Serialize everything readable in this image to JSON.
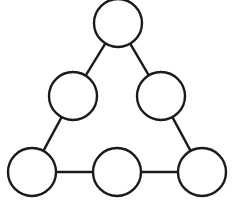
{
  "diagram": {
    "type": "triangle-node-graph",
    "nodes": [
      {
        "id": "top",
        "label": ""
      },
      {
        "id": "middle-left",
        "label": ""
      },
      {
        "id": "middle-right",
        "label": ""
      },
      {
        "id": "bottom-left",
        "label": ""
      },
      {
        "id": "bottom-middle",
        "label": ""
      },
      {
        "id": "bottom-right",
        "label": ""
      }
    ],
    "edges": [
      [
        "top",
        "middle-left"
      ],
      [
        "middle-left",
        "bottom-left"
      ],
      [
        "top",
        "middle-right"
      ],
      [
        "middle-right",
        "bottom-right"
      ],
      [
        "bottom-left",
        "bottom-middle"
      ],
      [
        "bottom-middle",
        "bottom-right"
      ]
    ],
    "colors": {
      "stroke": "#1a1a1a",
      "fill": "#ffffff",
      "background": "#ffffff"
    }
  }
}
